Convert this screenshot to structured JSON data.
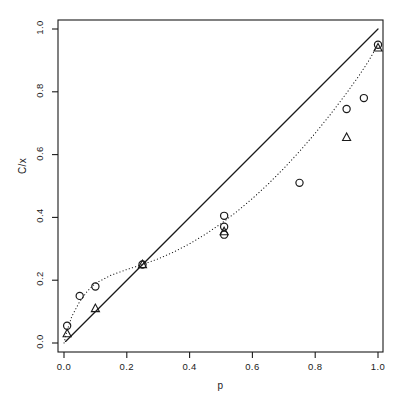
{
  "chart_data": {
    "type": "scatter",
    "title": "",
    "xlabel": "p",
    "ylabel": "C/x",
    "xlim": [
      -0.03,
      1.06
    ],
    "ylim": [
      -0.03,
      1.06
    ],
    "xticks": [
      0.0,
      0.2,
      0.4,
      0.6,
      0.8,
      1.0
    ],
    "xtick_labels": [
      "0.0",
      "0.2",
      "0.4",
      "0.6",
      "0.8",
      "1.0"
    ],
    "yticks": [
      0.0,
      0.2,
      0.4,
      0.6,
      0.8,
      1.0
    ],
    "ytick_labels": [
      "0.0",
      "0.2",
      "0.4",
      "0.6",
      "0.8",
      "1.0"
    ],
    "grid": false,
    "legend": "none",
    "frame": true,
    "series": [
      {
        "name": "circles",
        "marker": "open-circle",
        "color": "#1a1a1a",
        "points": [
          {
            "x": 0.01,
            "y": 0.055
          },
          {
            "x": 0.05,
            "y": 0.15
          },
          {
            "x": 0.1,
            "y": 0.18
          },
          {
            "x": 0.25,
            "y": 0.25
          },
          {
            "x": 0.51,
            "y": 0.405
          },
          {
            "x": 0.51,
            "y": 0.37
          },
          {
            "x": 0.51,
            "y": 0.345
          },
          {
            "x": 0.75,
            "y": 0.51
          },
          {
            "x": 0.9,
            "y": 0.745
          },
          {
            "x": 0.955,
            "y": 0.78
          },
          {
            "x": 1.0,
            "y": 0.95
          }
        ]
      },
      {
        "name": "triangles",
        "marker": "open-triangle",
        "color": "#1a1a1a",
        "points": [
          {
            "x": 0.01,
            "y": 0.03
          },
          {
            "x": 0.1,
            "y": 0.11
          },
          {
            "x": 0.25,
            "y": 0.25
          },
          {
            "x": 0.51,
            "y": 0.355
          },
          {
            "x": 0.9,
            "y": 0.655
          },
          {
            "x": 1.0,
            "y": 0.94
          }
        ]
      }
    ],
    "lines": [
      {
        "name": "identity-line",
        "style": "solid",
        "color": "#1a1a1a",
        "width": 1.3,
        "points": [
          {
            "x": 0.005,
            "y": 0.005
          },
          {
            "x": 1.0,
            "y": 1.0
          }
        ]
      },
      {
        "name": "fitted-curve",
        "style": "dotted",
        "color": "#1a1a1a",
        "width": 1.1,
        "points": [
          {
            "x": 0.0,
            "y": 0.0
          },
          {
            "x": 0.01,
            "y": 0.04
          },
          {
            "x": 0.025,
            "y": 0.085
          },
          {
            "x": 0.05,
            "y": 0.132
          },
          {
            "x": 0.075,
            "y": 0.166
          },
          {
            "x": 0.1,
            "y": 0.19
          },
          {
            "x": 0.15,
            "y": 0.216
          },
          {
            "x": 0.2,
            "y": 0.234
          },
          {
            "x": 0.25,
            "y": 0.25
          },
          {
            "x": 0.3,
            "y": 0.268
          },
          {
            "x": 0.35,
            "y": 0.29
          },
          {
            "x": 0.4,
            "y": 0.316
          },
          {
            "x": 0.45,
            "y": 0.346
          },
          {
            "x": 0.5,
            "y": 0.38
          },
          {
            "x": 0.55,
            "y": 0.418
          },
          {
            "x": 0.6,
            "y": 0.46
          },
          {
            "x": 0.65,
            "y": 0.506
          },
          {
            "x": 0.7,
            "y": 0.556
          },
          {
            "x": 0.75,
            "y": 0.61
          },
          {
            "x": 0.8,
            "y": 0.668
          },
          {
            "x": 0.85,
            "y": 0.73
          },
          {
            "x": 0.9,
            "y": 0.796
          },
          {
            "x": 0.94,
            "y": 0.852
          },
          {
            "x": 0.97,
            "y": 0.898
          },
          {
            "x": 1.0,
            "y": 0.95
          }
        ]
      }
    ]
  }
}
